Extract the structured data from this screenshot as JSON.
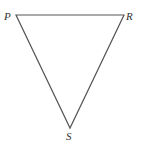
{
  "diagram": {
    "type": "triangle",
    "stroke_color": "#555555",
    "vertices": [
      {
        "label": "P",
        "x": 16,
        "y": 15
      },
      {
        "label": "R",
        "x": 124,
        "y": 15
      },
      {
        "label": "S",
        "x": 70,
        "y": 128
      }
    ],
    "edges": [
      [
        "P",
        "R"
      ],
      [
        "R",
        "S"
      ],
      [
        "S",
        "P"
      ]
    ]
  }
}
